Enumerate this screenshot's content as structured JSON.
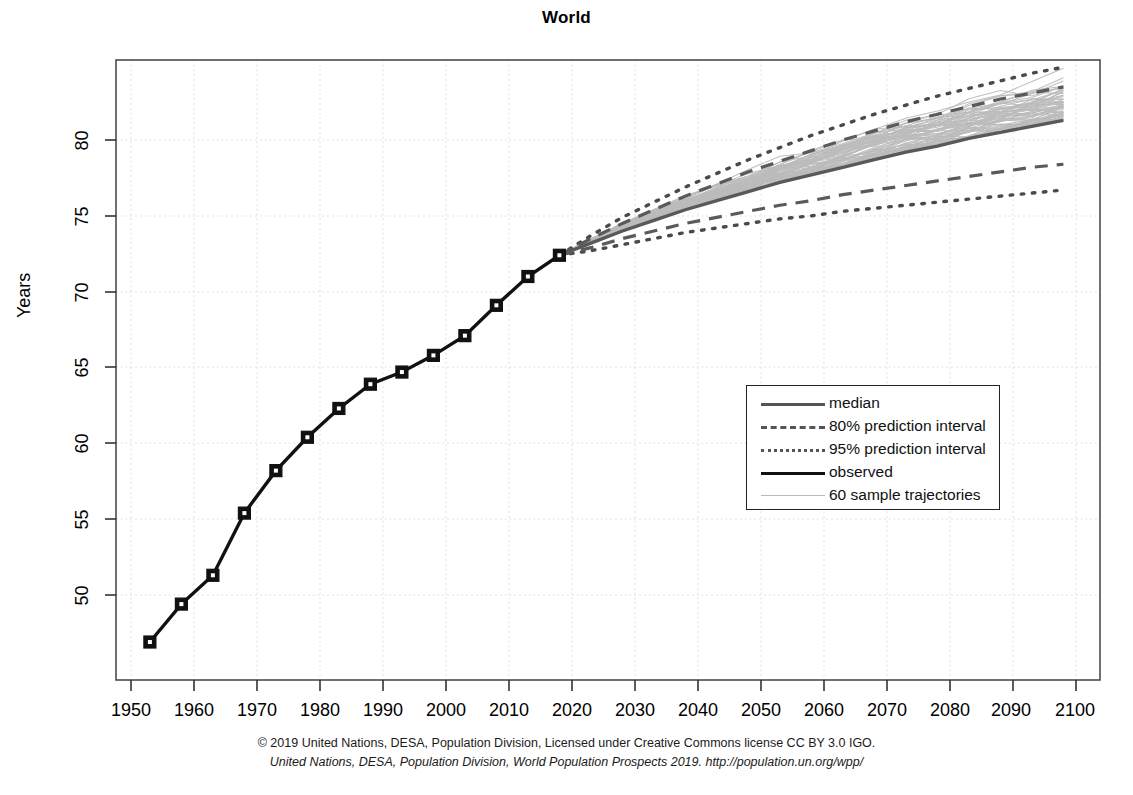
{
  "chart_data": {
    "type": "line",
    "title": "World",
    "xlabel": "",
    "ylabel": "Years",
    "xlim": [
      1950,
      2100
    ],
    "ylim": [
      46,
      84
    ],
    "grid": true,
    "legend_position": "center-right",
    "xticks": [
      "1950",
      "1960",
      "1970",
      "1980",
      "1990",
      "2000",
      "2010",
      "2020",
      "2030",
      "2040",
      "2050",
      "2060",
      "2070",
      "2080",
      "2090",
      "2100"
    ],
    "yticks": [
      "50",
      "55",
      "60",
      "65",
      "70",
      "75",
      "80"
    ],
    "series": [
      {
        "name": "observed",
        "style": "solid-thick-with-square-markers",
        "color": "#111111",
        "x": [
          1953,
          1958,
          1963,
          1968,
          1973,
          1978,
          1983,
          1988,
          1993,
          1998,
          2003,
          2008,
          2013,
          2018
        ],
        "values": [
          46.9,
          49.4,
          51.3,
          55.4,
          58.2,
          60.4,
          62.3,
          63.9,
          64.7,
          65.8,
          67.1,
          69.1,
          71.0,
          72.4
        ]
      },
      {
        "name": "median",
        "style": "solid",
        "color": "#595959",
        "x": [
          2018,
          2023,
          2028,
          2033,
          2038,
          2043,
          2048,
          2053,
          2058,
          2063,
          2068,
          2073,
          2078,
          2083,
          2088,
          2093,
          2098
        ],
        "values": [
          72.4,
          73.2,
          74.0,
          74.7,
          75.4,
          76.0,
          76.6,
          77.2,
          77.7,
          78.2,
          78.7,
          79.2,
          79.6,
          80.1,
          80.5,
          80.9,
          81.3
        ]
      },
      {
        "name": "80% prediction interval upper",
        "style": "dashed",
        "color": "#5a5a5a",
        "x": [
          2018,
          2023,
          2028,
          2033,
          2038,
          2043,
          2048,
          2053,
          2058,
          2063,
          2068,
          2073,
          2078,
          2083,
          2088,
          2093,
          2098
        ],
        "values": [
          72.4,
          73.5,
          74.5,
          75.4,
          76.3,
          77.1,
          77.9,
          78.6,
          79.3,
          80.0,
          80.6,
          81.2,
          81.7,
          82.2,
          82.7,
          83.1,
          83.5
        ]
      },
      {
        "name": "80% prediction interval lower",
        "style": "dashed",
        "color": "#5a5a5a",
        "x": [
          2018,
          2023,
          2028,
          2033,
          2038,
          2043,
          2048,
          2053,
          2058,
          2063,
          2068,
          2073,
          2078,
          2083,
          2088,
          2093,
          2098
        ],
        "values": [
          72.4,
          72.9,
          73.5,
          74.0,
          74.5,
          74.9,
          75.3,
          75.7,
          76.0,
          76.4,
          76.7,
          77.0,
          77.3,
          77.6,
          77.9,
          78.2,
          78.4
        ]
      },
      {
        "name": "95% prediction interval upper",
        "style": "dotted",
        "color": "#4a4a4a",
        "x": [
          2018,
          2023,
          2028,
          2033,
          2038,
          2043,
          2048,
          2053,
          2058,
          2063,
          2068,
          2073,
          2078,
          2083,
          2088,
          2093,
          2098
        ],
        "values": [
          72.4,
          73.7,
          74.9,
          75.9,
          76.9,
          77.8,
          78.7,
          79.5,
          80.3,
          81.0,
          81.7,
          82.3,
          82.9,
          83.4,
          83.9,
          84.4,
          84.8
        ]
      },
      {
        "name": "95% prediction interval lower",
        "style": "dotted",
        "color": "#4a4a4a",
        "x": [
          2018,
          2023,
          2028,
          2033,
          2038,
          2043,
          2048,
          2053,
          2058,
          2063,
          2068,
          2073,
          2078,
          2083,
          2088,
          2093,
          2098
        ],
        "values": [
          72.4,
          72.7,
          73.1,
          73.5,
          73.9,
          74.2,
          74.5,
          74.8,
          75.0,
          75.3,
          75.5,
          75.7,
          75.9,
          76.1,
          76.3,
          76.5,
          76.7
        ]
      },
      {
        "name": "60 sample trajectories",
        "style": "thin-light",
        "color": "#bcbcbc",
        "count": 60,
        "note": "individual stochastic projections fanning between the 95% bounds from 2018 to 2100"
      }
    ]
  },
  "legend": {
    "items": [
      {
        "key": "solid-median",
        "label": "median"
      },
      {
        "key": "dashed",
        "label": "80% prediction interval"
      },
      {
        "key": "dotted",
        "label": "95% prediction interval"
      },
      {
        "key": "solid-observed",
        "label": " observed"
      },
      {
        "key": "thin",
        "label": "60 sample trajectories"
      }
    ]
  },
  "caption": {
    "line1": "© 2019 United Nations, DESA, Population Division, Licensed under Creative Commons license CC BY 3.0 IGO.",
    "line2": "United Nations, DESA, Population Division, World Population Prospects 2019. http://population.un.org/wpp/"
  }
}
